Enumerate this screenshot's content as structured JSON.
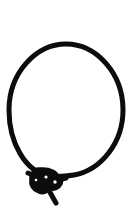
{
  "image": {
    "title": "Knotted cord loop",
    "subject": "cord-necklace-loop-with-knot",
    "style": "black line art silhouette on white background",
    "width": 135,
    "height": 217,
    "background_color": "#ffffff",
    "ink_color": "#0c0c0c"
  },
  "drawing": {
    "loop": {
      "name": "cord-loop",
      "shape": "oval",
      "center_x": 66,
      "center_y": 110,
      "radius_x": 57,
      "radius_y": 66,
      "stroke_width": 5,
      "top_y": 44,
      "bottom_y": 176,
      "left_x": 9,
      "right_x": 123
    },
    "knot": {
      "name": "cord-knot",
      "center_x": 44,
      "center_y": 181,
      "width": 30,
      "height": 26,
      "highlight_holes": [
        {
          "cx": 46,
          "cy": 177,
          "r": 1.6
        },
        {
          "cx": 55,
          "cy": 182,
          "r": 1.7
        },
        {
          "cx": 36,
          "cy": 180,
          "r": 1.3
        }
      ]
    },
    "tail": {
      "name": "cord-tail",
      "start_x": 48,
      "start_y": 188,
      "end_x": 56,
      "end_y": 203,
      "stroke_width": 5
    },
    "knot_arm_left": {
      "name": "knot-arm-left",
      "start_x": 31,
      "start_y": 175,
      "end_x": 44,
      "end_y": 181
    },
    "knot_arm_right": {
      "name": "knot-arm-right",
      "start_x": 44,
      "start_y": 181,
      "end_x": 64,
      "end_y": 179
    }
  }
}
